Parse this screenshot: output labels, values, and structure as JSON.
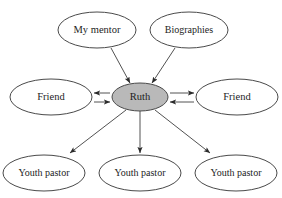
{
  "diagram": {
    "background_color": "#ffffff",
    "stroke_color": "#4a4a4a",
    "edge_color": "#525252",
    "center_fill_color": "#b9b9b9",
    "node_fill_color": "#ffffff",
    "text_color": "#1d1d1d",
    "center": {
      "id": "ruth",
      "label": "Ruth",
      "cx": 140,
      "cy": 97,
      "rx": 28,
      "ry": 14
    },
    "nodes": [
      {
        "id": "my-mentor",
        "label": "My mentor",
        "cx": 97,
        "cy": 30,
        "rx": 39,
        "ry": 18
      },
      {
        "id": "biographies",
        "label": "Biographies",
        "cx": 189,
        "cy": 30,
        "rx": 39,
        "ry": 18
      },
      {
        "id": "friend-left",
        "label": "Friend",
        "cx": 51,
        "cy": 97,
        "rx": 41,
        "ry": 18
      },
      {
        "id": "friend-right",
        "label": "Friend",
        "cx": 237,
        "cy": 97,
        "rx": 41,
        "ry": 18
      },
      {
        "id": "youth-pastor-left",
        "label": "Youth pastor",
        "cx": 44,
        "cy": 173,
        "rx": 41,
        "ry": 18
      },
      {
        "id": "youth-pastor-center",
        "label": "Youth pastor",
        "cx": 140,
        "cy": 173,
        "rx": 41,
        "ry": 18
      },
      {
        "id": "youth-pastor-right",
        "label": "Youth pastor",
        "cx": 236,
        "cy": 173,
        "rx": 41,
        "ry": 18
      }
    ],
    "edges": [
      {
        "id": "edge-my-mentor-to-ruth",
        "from": "my-mentor",
        "to": "ruth",
        "direction": "to-center",
        "x1": 111,
        "y1": 48,
        "x2": 130,
        "y2": 83
      },
      {
        "id": "edge-biographies-to-ruth",
        "from": "biographies",
        "to": "ruth",
        "direction": "to-center",
        "x1": 175,
        "y1": 48,
        "x2": 152,
        "y2": 83
      },
      {
        "id": "edge-ruth-to-friend-left",
        "from": "ruth",
        "to": "friend-left",
        "direction": "to-node",
        "x1": 110,
        "y1": 93,
        "x2": 94,
        "y2": 93
      },
      {
        "id": "edge-friend-left-to-ruth",
        "from": "friend-left",
        "to": "ruth",
        "direction": "to-center",
        "x1": 94,
        "y1": 102,
        "x2": 110,
        "y2": 102
      },
      {
        "id": "edge-ruth-to-friend-right",
        "from": "ruth",
        "to": "friend-right",
        "direction": "to-node",
        "x1": 170,
        "y1": 93,
        "x2": 194,
        "y2": 93
      },
      {
        "id": "edge-friend-right-to-ruth",
        "from": "friend-right",
        "to": "ruth",
        "direction": "to-center",
        "x1": 194,
        "y1": 102,
        "x2": 170,
        "y2": 102
      },
      {
        "id": "edge-ruth-to-youth-pastor-left",
        "from": "ruth",
        "to": "youth-pastor-left",
        "direction": "to-node",
        "x1": 126,
        "y1": 110,
        "x2": 70,
        "y2": 153
      },
      {
        "id": "edge-ruth-to-youth-pastor-center",
        "from": "ruth",
        "to": "youth-pastor-center",
        "direction": "to-node",
        "x1": 140,
        "y1": 111,
        "x2": 140,
        "y2": 153
      },
      {
        "id": "edge-ruth-to-youth-pastor-right",
        "from": "ruth",
        "to": "youth-pastor-right",
        "direction": "to-node",
        "x1": 155,
        "y1": 110,
        "x2": 210,
        "y2": 153
      }
    ]
  }
}
